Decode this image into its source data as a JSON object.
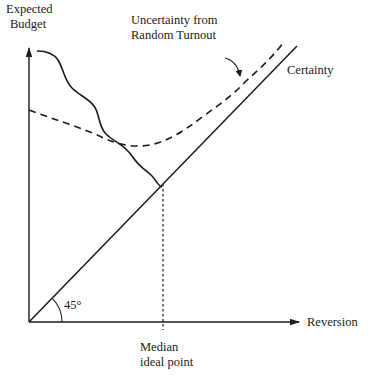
{
  "diagram": {
    "type": "economic-graph",
    "y_axis": {
      "label_line1": "Expected",
      "label_line2": "Budget"
    },
    "x_axis": {
      "label": "Reversion"
    },
    "angle_label": "45°",
    "median_label_line1": "Median",
    "median_label_line2": "ideal point",
    "curves": {
      "certainty": {
        "label": "Certainty",
        "style": "solid"
      },
      "uncertainty": {
        "label_line1": "Uncertainty from",
        "label_line2": "Random Turnout",
        "style": "dashed"
      },
      "wavy": {
        "style": "solid"
      }
    },
    "colors": {
      "ink": "#1a1a1a",
      "background": "#ffffff"
    }
  }
}
